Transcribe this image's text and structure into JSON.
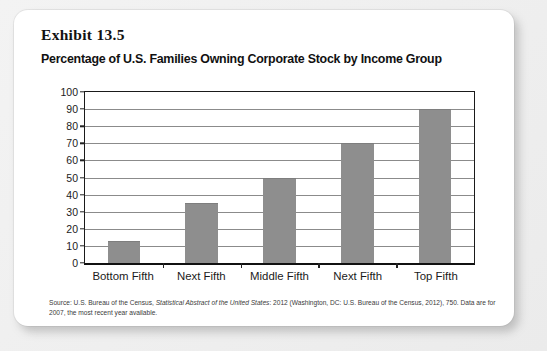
{
  "exhibit": {
    "label": "Exhibit 13.5",
    "title": "Percentage of U.S. Families Owning Corporate Stock by Income Group"
  },
  "chart_data": {
    "type": "bar",
    "title": "Percentage of U.S. Families Owning Corporate Stock by Income Group",
    "categories": [
      "Bottom Fifth",
      "Next Fifth",
      "Middle Fifth",
      "Next Fifth",
      "Top Fifth"
    ],
    "values": [
      13,
      35,
      50,
      70,
      90
    ],
    "xlabel": "",
    "ylabel": "",
    "ylim": [
      0,
      100
    ],
    "yticks": [
      0,
      10,
      20,
      30,
      40,
      50,
      60,
      70,
      80,
      90,
      100
    ],
    "grid": true,
    "legend": false,
    "bar_color": "#8e8e8e"
  },
  "source": {
    "line1_pre": "Source: U.S. Bureau of the Census, ",
    "line1_italic": "Statistical Abstract of the United States",
    "line1_post": ": 2012 (Washington, DC: U.S. Bureau of the Census,",
    "line2": "2012), 750. Data are for 2007, the most recent year available."
  }
}
